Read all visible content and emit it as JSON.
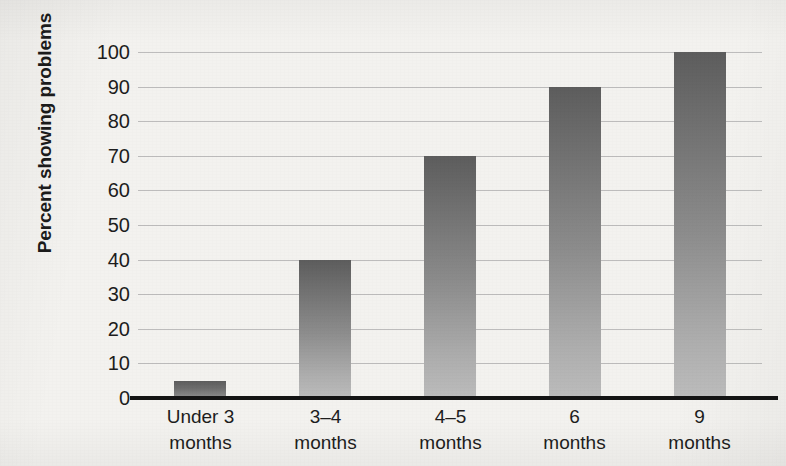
{
  "chart_data": {
    "type": "bar",
    "title": "",
    "subtitle": "",
    "xlabel": "",
    "ylabel": "Percent showing problems",
    "categories": [
      "Under 3 months",
      "3–4 months",
      "4–5 months",
      "6 months",
      "9 months"
    ],
    "category_lines": [
      {
        "line1": "Under 3",
        "line2": "months"
      },
      {
        "line1": "3–4",
        "line2": "months"
      },
      {
        "line1": "4–5",
        "line2": "months"
      },
      {
        "line1": "6",
        "line2": "months"
      },
      {
        "line1": "9",
        "line2": "months"
      }
    ],
    "values": [
      5,
      40,
      70,
      90,
      100
    ],
    "ylim": [
      0,
      100
    ],
    "ytick_step": 10,
    "yticks": [
      "100",
      "90",
      "80",
      "70",
      "60",
      "50",
      "40",
      "30",
      "20",
      "10",
      "0"
    ],
    "grid": "horizontal",
    "legend": "none",
    "bar_color_top": "#5d5d5d",
    "bar_color_bottom": "#bcbcbc",
    "gridline_color": "#b3b3b3",
    "axis_color": "#141414",
    "background_color": "#f3f2ef",
    "text_color": "#1d1d1d"
  }
}
